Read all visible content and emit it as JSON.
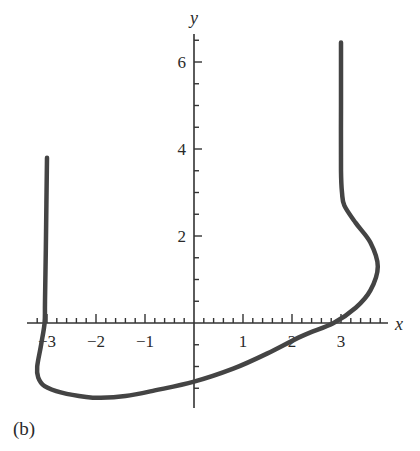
{
  "chart_data": {
    "type": "line",
    "title": "",
    "panel_label": "(b)",
    "xlabel": "x",
    "ylabel": "y",
    "xlim": [
      -3.2,
      3.9
    ],
    "ylim": [
      -1.8,
      6.6
    ],
    "grid": false,
    "legend": null,
    "x_ticks": [
      -3,
      -2,
      -1,
      1,
      2,
      3
    ],
    "x_tick_labels": [
      "−3",
      "−2",
      "−1",
      "1",
      "2",
      "3"
    ],
    "x_minor_tick_step": 0.2,
    "y_ticks": [
      2,
      4,
      6
    ],
    "y_tick_labels": [
      "2",
      "4",
      "6"
    ],
    "y_minor_tick_step": 0.5,
    "series": [
      {
        "name": "curve",
        "color": "#444444",
        "points": [
          [
            -3.0,
            3.8
          ],
          [
            -3.02,
            2.0
          ],
          [
            -3.04,
            0.5
          ],
          [
            -3.05,
            0.0
          ],
          [
            -3.12,
            -0.5
          ],
          [
            -3.2,
            -1.0
          ],
          [
            -3.18,
            -1.25
          ],
          [
            -3.05,
            -1.45
          ],
          [
            -2.7,
            -1.6
          ],
          [
            -2.2,
            -1.7
          ],
          [
            -1.9,
            -1.72
          ],
          [
            -1.4,
            -1.68
          ],
          [
            -0.8,
            -1.55
          ],
          [
            0.0,
            -1.35
          ],
          [
            0.8,
            -1.05
          ],
          [
            1.5,
            -0.7
          ],
          [
            2.2,
            -0.3
          ],
          [
            2.85,
            0.0
          ],
          [
            3.3,
            0.35
          ],
          [
            3.6,
            0.75
          ],
          [
            3.75,
            1.3
          ],
          [
            3.6,
            1.85
          ],
          [
            3.3,
            2.3
          ],
          [
            3.07,
            2.7
          ],
          [
            3.02,
            3.0
          ],
          [
            3.0,
            3.5
          ],
          [
            3.0,
            5.0
          ],
          [
            3.0,
            6.45
          ]
        ]
      }
    ]
  },
  "labels": {
    "panel": "(b)",
    "x_axis": "x",
    "y_axis": "y"
  }
}
